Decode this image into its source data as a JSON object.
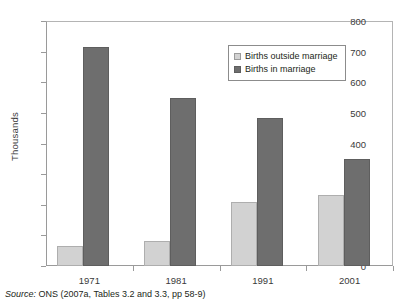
{
  "figure": {
    "top_strip_text": "",
    "source_prefix": "Source:",
    "source_text": " ONS (2007a, Tables 3.2 and 3.3, pp 58-9)"
  },
  "legend": {
    "position": "top-right-inside-plot",
    "items": [
      {
        "label": "Births outside marriage",
        "color": "#d2d2d2",
        "swatch": "outside"
      },
      {
        "label": "Births in marriage",
        "color": "#6e6e6e",
        "swatch": "inside"
      }
    ]
  },
  "chart_data": {
    "type": "bar",
    "title": "",
    "subtitle": "",
    "xlabel": "",
    "ylabel": "Thousands",
    "categories": [
      "1971",
      "1981",
      "1991",
      "2001"
    ],
    "series": [
      {
        "name": "Births outside marriage",
        "color": "#d2d2d2",
        "values": [
          65,
          81,
          208,
          232
        ]
      },
      {
        "name": "Births in marriage",
        "color": "#6e6e6e",
        "values": [
          715,
          548,
          482,
          350
        ]
      }
    ],
    "ylim": [
      0,
      800
    ],
    "yticks": [
      0,
      100,
      200,
      300,
      400,
      500,
      600,
      700,
      800
    ],
    "ytick_labels": [
      "0",
      "100",
      "200",
      "300",
      "400",
      "500",
      "600",
      "700",
      "800"
    ],
    "grid": false,
    "legend_position": "inside top right",
    "annotations": []
  }
}
